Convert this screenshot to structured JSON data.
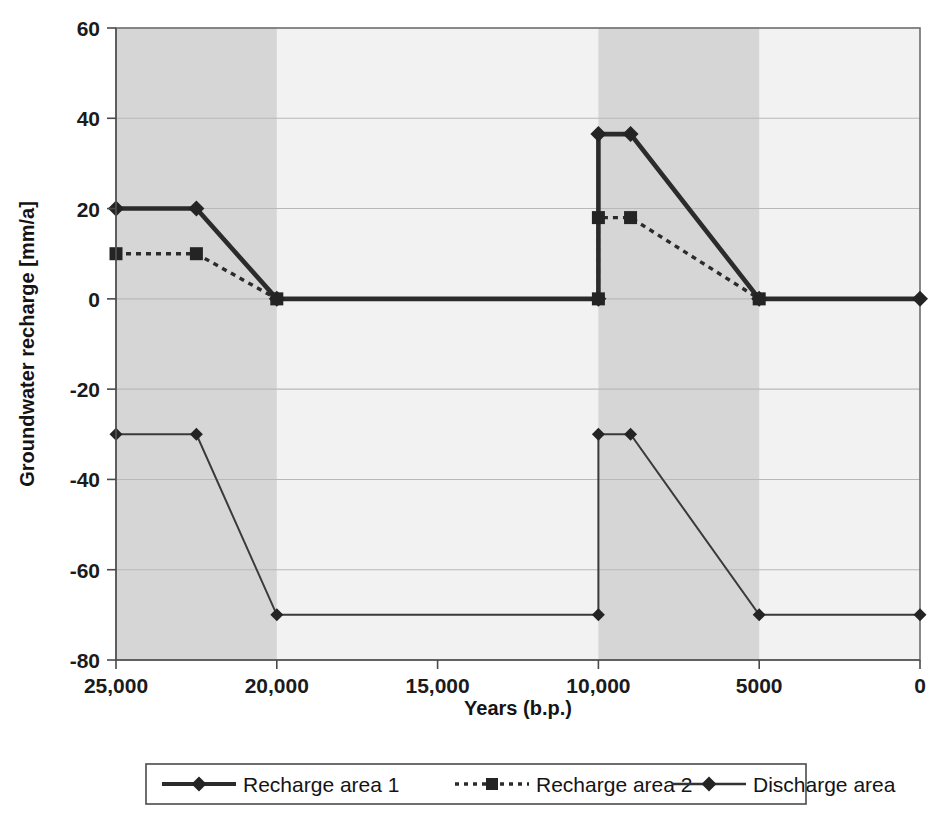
{
  "chart_data": {
    "type": "line",
    "title": "",
    "xlabel": "Years (b.p.)",
    "ylabel": "Groundwater recharge [mm/a]",
    "xlim": [
      25000,
      0
    ],
    "ylim": [
      -80,
      60
    ],
    "x_reversed": true,
    "grid": true,
    "legend_position": "bottom",
    "xticks": [
      25000,
      20000,
      15000,
      10000,
      5000,
      0
    ],
    "xticklabels": [
      "25,000",
      "20,000",
      "15,000",
      "10,000",
      "5000",
      "0"
    ],
    "yticks": [
      60,
      40,
      20,
      0,
      -20,
      -40,
      -60,
      -80
    ],
    "yticklabels": [
      "60",
      "40",
      "20",
      "0",
      "-20",
      "-40",
      "-60",
      "-80"
    ],
    "shaded_bands": [
      {
        "from": 25000,
        "to": 20000,
        "color": "#d6d6d6"
      },
      {
        "from": 10000,
        "to": 5000,
        "color": "#d6d6d6"
      }
    ],
    "background_color": "#f2f2f2",
    "series": [
      {
        "name": "Recharge area 1",
        "style": "solid-thick",
        "marker": "diamond",
        "color": "#2b2b2b",
        "x": [
          25000,
          22500,
          20000,
          10000,
          10000,
          9000,
          5000,
          0
        ],
        "y": [
          20,
          20,
          0,
          0,
          36.5,
          36.5,
          0,
          0
        ]
      },
      {
        "name": "Recharge area 2",
        "style": "dotted",
        "marker": "square",
        "color": "#2b2b2b",
        "x": [
          25000,
          22500,
          20000,
          10000,
          10000,
          9000,
          5000
        ],
        "y": [
          10,
          10,
          0,
          0,
          18,
          18,
          0
        ]
      },
      {
        "name": "Discharge area",
        "style": "solid-thin",
        "marker": "diamond",
        "color": "#3a3a3a",
        "x": [
          25000,
          22500,
          20000,
          10000,
          10000,
          9000,
          5000,
          0
        ],
        "y": [
          -30,
          -30,
          -70,
          -70,
          -30,
          -30,
          -70,
          -70
        ]
      }
    ]
  },
  "legend": {
    "entries": [
      {
        "label": "Recharge area 1",
        "style": "solid-thick",
        "marker": "diamond"
      },
      {
        "label": "Recharge area 2",
        "style": "dotted",
        "marker": "square"
      },
      {
        "label": "Discharge area",
        "style": "solid-thin",
        "marker": "diamond"
      }
    ]
  },
  "axes": {
    "y_title": "Groundwater recharge [mm/a]",
    "x_title": "Years (b.p.)",
    "y_tick_0": "60",
    "y_tick_1": "40",
    "y_tick_2": "20",
    "y_tick_3": "0",
    "y_tick_4": "-20",
    "y_tick_5": "-40",
    "y_tick_6": "-60",
    "y_tick_7": "-80",
    "x_tick_0": "25,000",
    "x_tick_1": "20,000",
    "x_tick_2": "15,000",
    "x_tick_3": "10,000",
    "x_tick_4": "5000",
    "x_tick_5": "0"
  }
}
